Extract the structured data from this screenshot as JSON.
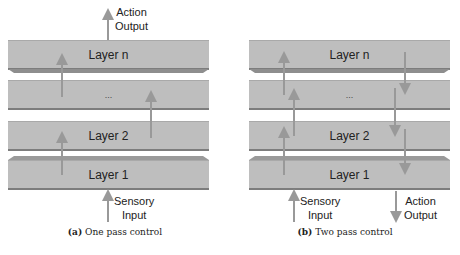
{
  "panels": [
    {
      "id": "a",
      "layers": [
        "Layer n",
        "...",
        "Layer 2",
        "Layer 1"
      ],
      "top_label": [
        "Action",
        "Output"
      ],
      "bottom_left_label": [
        "Sensory",
        "Input"
      ],
      "caption_tag": "(a)",
      "caption_text": "One pass control"
    },
    {
      "id": "b",
      "layers": [
        "Layer n",
        "...",
        "Layer 2",
        "Layer 1"
      ],
      "bottom_left_label": [
        "Sensory",
        "Input"
      ],
      "bottom_right_label": [
        "Action",
        "Output"
      ],
      "caption_tag": "(b)",
      "caption_text": "Two pass control"
    }
  ],
  "colors": {
    "layer_fill": "#bebebe",
    "arrow": "#999999",
    "bevel": "#8e8e8e"
  }
}
